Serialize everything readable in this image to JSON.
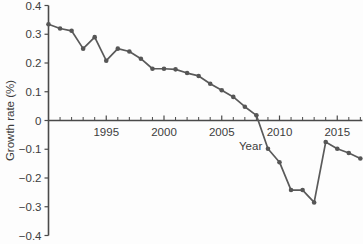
{
  "chart_data": {
    "type": "line",
    "title": "",
    "xlabel": "Year",
    "ylabel": "Growth rate (%)",
    "xlim": [
      1990,
      2017
    ],
    "ylim": [
      -0.4,
      0.4
    ],
    "grid": false,
    "legend": "none",
    "marker": "filled-circle",
    "line_color": "#565656",
    "x_tick_labels": [
      "1995",
      "2000",
      "2005",
      "2010",
      "2015"
    ],
    "x_tick_values": [
      1995,
      2000,
      2005,
      2010,
      2015
    ],
    "x_minor_tick_step": 1,
    "y_tick_labels": [
      "0.4",
      "0.3",
      "0.2",
      "0.1",
      "0",
      "−0.1",
      "−0.2",
      "−0.3",
      "−0.4"
    ],
    "y_tick_values": [
      0.4,
      0.3,
      0.2,
      0.1,
      0,
      -0.1,
      -0.2,
      -0.3,
      -0.4
    ],
    "x": [
      1990,
      1991,
      1992,
      1993,
      1994,
      1995,
      1996,
      1997,
      1998,
      1999,
      2000,
      2001,
      2002,
      2003,
      2004,
      2005,
      2006,
      2007,
      2008,
      2009,
      2010,
      2011,
      2012,
      2013,
      2014,
      2015,
      2016,
      2017
    ],
    "values": [
      0.335,
      0.32,
      0.312,
      0.25,
      0.29,
      0.208,
      0.25,
      0.24,
      0.215,
      0.18,
      0.18,
      0.178,
      0.165,
      0.155,
      0.128,
      0.105,
      0.082,
      0.048,
      0.018,
      -0.098,
      -0.145,
      -0.242,
      -0.242,
      -0.285,
      -0.075,
      -0.098,
      -0.113,
      -0.132
    ],
    "series": [
      {
        "name": "Growth rate",
        "points": [
          {
            "x": 1990,
            "y": 0.335
          },
          {
            "x": 1991,
            "y": 0.32
          },
          {
            "x": 1992,
            "y": 0.312
          },
          {
            "x": 1993,
            "y": 0.25
          },
          {
            "x": 1994,
            "y": 0.29
          },
          {
            "x": 1995,
            "y": 0.208
          },
          {
            "x": 1996,
            "y": 0.25
          },
          {
            "x": 1997,
            "y": 0.24
          },
          {
            "x": 1998,
            "y": 0.215
          },
          {
            "x": 1999,
            "y": 0.18
          },
          {
            "x": 2000,
            "y": 0.18
          },
          {
            "x": 2001,
            "y": 0.178
          },
          {
            "x": 2002,
            "y": 0.165
          },
          {
            "x": 2003,
            "y": 0.155
          },
          {
            "x": 2004,
            "y": 0.128
          },
          {
            "x": 2005,
            "y": 0.105
          },
          {
            "x": 2006,
            "y": 0.082
          },
          {
            "x": 2007,
            "y": 0.048
          },
          {
            "x": 2008,
            "y": 0.018
          },
          {
            "x": 2009,
            "y": -0.098
          },
          {
            "x": 2010,
            "y": -0.145
          },
          {
            "x": 2011,
            "y": -0.242
          },
          {
            "x": 2012,
            "y": -0.242
          },
          {
            "x": 2013,
            "y": -0.285
          },
          {
            "x": 2014,
            "y": -0.075
          },
          {
            "x": 2015,
            "y": -0.098
          },
          {
            "x": 2016,
            "y": -0.113
          },
          {
            "x": 2017,
            "y": -0.132
          }
        ]
      }
    ]
  }
}
